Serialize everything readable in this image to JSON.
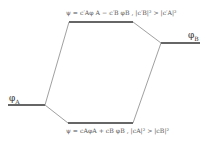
{
  "diagram": {
    "type": "molecular-orbital-energy-diagram",
    "left_level": {
      "label": "φ",
      "sub": "A"
    },
    "right_level": {
      "label": "φ",
      "sub": "B"
    },
    "upper_mo": {
      "equation": "ψ = c′Aφ A − c′B φB ,  |c′B|² > |c′A|²"
    },
    "lower_mo": {
      "equation": "ψ = cAφA + cB φB ,  |cA|² > |cB|²"
    },
    "colors": {
      "line": "#444444",
      "text": "#333333"
    }
  }
}
